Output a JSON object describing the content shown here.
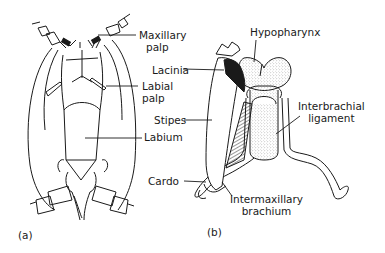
{
  "figure": {
    "panels": [
      {
        "id": "a",
        "caption": "(a)",
        "labels": {
          "maxillary_palp": "Maxillary\npalp",
          "maxillary_palp_l1": "Maxillary",
          "maxillary_palp_l2": "palp",
          "labial_palp_l1": "Labial",
          "labial_palp_l2": "palp",
          "labium": "Labium"
        }
      },
      {
        "id": "b",
        "caption": "(b)",
        "labels": {
          "hypopharynx": "Hypopharynx",
          "lacinia": "Lacinia",
          "stipes": "Stipes",
          "cardo": "Cardo",
          "interbrachial_l1": "Interbrachial",
          "interbrachial_l2": "ligament",
          "intermaxillary_l1": "Intermaxillary",
          "intermaxillary_l2": "brachium"
        }
      }
    ],
    "colors": {
      "ink": "#1a1a1a",
      "stipple": "#9a9a9a",
      "background": "#ffffff"
    }
  }
}
